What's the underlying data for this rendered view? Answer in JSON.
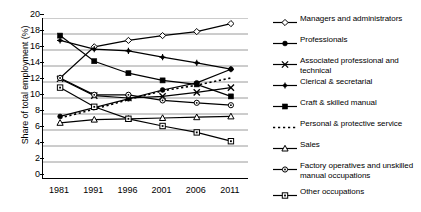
{
  "chart_data": {
    "type": "line",
    "title": "",
    "xlabel": "",
    "ylabel": "Share of total employment (%)",
    "categories": [
      "1981",
      "1991",
      "1996",
      "2001",
      "2006",
      "2011"
    ],
    "ylim": [
      0,
      20
    ],
    "ytick_step": 2,
    "yticks": [
      "20",
      "18",
      "16",
      "14",
      "12",
      "10",
      "8",
      "6",
      "4",
      "2",
      "0"
    ],
    "grid": "horizontal",
    "legend_position": "right",
    "series": [
      {
        "name": "Managers and administrators",
        "marker": "open-diamond",
        "line": "solid",
        "values": [
          12.5,
          16.4,
          17.2,
          17.8,
          18.3,
          19.3
        ]
      },
      {
        "name": "Professionals",
        "marker": "filled-circle",
        "line": "solid",
        "values": [
          7.7,
          8.8,
          9.9,
          11.0,
          11.9,
          13.6
        ]
      },
      {
        "name": "Associated professional and technical",
        "marker": "x-cross",
        "line": "solid",
        "values": [
          12.4,
          10.3,
          10.0,
          10.2,
          10.7,
          11.3
        ]
      },
      {
        "name": "Clerical & secretarial",
        "marker": "filled-star",
        "line": "solid",
        "values": [
          17.2,
          16.1,
          15.9,
          15.1,
          14.4,
          13.6
        ]
      },
      {
        "name": "Craft & skilled manual",
        "marker": "filled-square",
        "line": "solid",
        "values": [
          17.8,
          14.6,
          13.1,
          12.2,
          11.7,
          10.2
        ]
      },
      {
        "name": "Personal & protective service",
        "marker": "none",
        "line": "dotted",
        "values": [
          7.5,
          8.6,
          9.8,
          10.9,
          11.6,
          12.5
        ]
      },
      {
        "name": "Sales",
        "marker": "open-triangle",
        "line": "solid",
        "values": [
          6.9,
          7.3,
          7.4,
          7.5,
          7.6,
          7.7
        ]
      },
      {
        "name": "Factory operatives and unskilled manual occupations",
        "marker": "open-circle",
        "line": "solid",
        "values": [
          12.5,
          10.4,
          10.4,
          9.7,
          9.4,
          9.1
        ]
      },
      {
        "name": "Other occupations",
        "marker": "open-square",
        "line": "solid",
        "values": [
          11.3,
          8.9,
          7.4,
          6.5,
          5.7,
          4.6
        ]
      }
    ]
  },
  "legend": {
    "items": [
      {
        "label": "Managers and administrators",
        "marker": "open-diamond"
      },
      {
        "label": "Professionals",
        "marker": "filled-circle"
      },
      {
        "label": "Associated professional and\ntechnical",
        "marker": "x-cross"
      },
      {
        "label": "Clerical & secretarial",
        "marker": "filled-star"
      },
      {
        "label": "Craft & skilled manual",
        "marker": "filled-square"
      },
      {
        "label": "Personal & protective service",
        "marker": "none"
      },
      {
        "label": "Sales",
        "marker": "open-triangle"
      },
      {
        "label": "Factory operatives and unskilled\nmanual occupations",
        "marker": "open-circle"
      },
      {
        "label": "Other occupations",
        "marker": "open-square"
      }
    ]
  },
  "colors": {
    "line": "#000000",
    "grid": "#808080",
    "axis": "#000000",
    "background": "#ffffff"
  }
}
